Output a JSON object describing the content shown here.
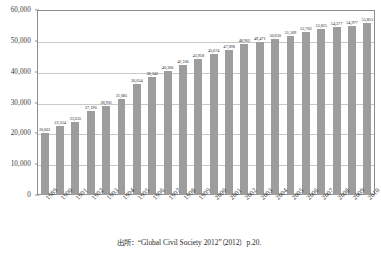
{
  "chart_data": {
    "type": "bar",
    "title": "",
    "xlabel": "",
    "ylabel": "",
    "ylim": [
      0,
      60000
    ],
    "y_ticks": [
      "0",
      "10,000",
      "20,000",
      "30,000",
      "40,000",
      "50,000",
      "60,000"
    ],
    "y_tick_values": [
      0,
      10000,
      20000,
      30000,
      40000,
      50000,
      60000
    ],
    "grid": true,
    "legend": "none",
    "bar_color": "#9d9d9d",
    "categories": [
      "1989",
      "1990",
      "1991",
      "1992",
      "1993",
      "1994",
      "1995",
      "1996",
      "1997",
      "1998",
      "1999",
      "2000",
      "2001",
      "2002",
      "2003",
      "2004",
      "2005",
      "2006",
      "2007",
      "2008",
      "2009",
      "2010"
    ],
    "values": [
      20061,
      22334,
      23635,
      27190,
      28901,
      31085,
      36054,
      38243,
      40306,
      42100,
      43958,
      45674,
      47098,
      48902,
      49471,
      50650,
      51509,
      52763,
      53815,
      54377,
      54977,
      55853
    ],
    "data_labels": [
      "20,061",
      "22,334",
      "23,635",
      "27,190",
      "28,901",
      "31,085",
      "36,054",
      "38,243",
      "40,306",
      "42,100",
      "43,958",
      "45,674",
      "47,098",
      "48,902",
      "49,471",
      "50,650",
      "51,509",
      "52,763",
      "53,815",
      "54,377",
      "54,977",
      "55,853"
    ]
  },
  "source": {
    "text": "出所：“Global Civil Society 2012”（2012）p.20."
  }
}
